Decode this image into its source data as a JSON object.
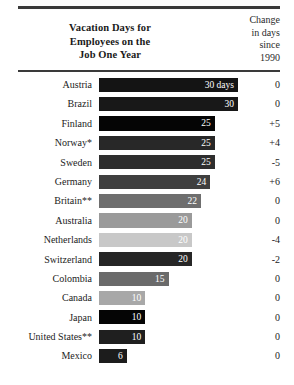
{
  "header": {
    "title_lines": [
      "Vacation Days for",
      "Employees on the",
      "Job One Year"
    ],
    "change_column_lines": [
      "Change",
      "in days",
      "since",
      "1990"
    ]
  },
  "chart_data": {
    "type": "bar",
    "title": "Vacation Days for Employees on the Job One Year",
    "xlabel": "",
    "ylabel": "",
    "orientation": "horizontal",
    "grid": false,
    "legend": null,
    "xlim": [
      0,
      30
    ],
    "categories": [
      "Austria",
      "Brazil",
      "Finland",
      "Norway*",
      "Sweden",
      "Germany",
      "Britain**",
      "Australia",
      "Netherlands",
      "Switzerland",
      "Colombia",
      "Canada",
      "Japan",
      "United States**",
      "Mexico"
    ],
    "values": [
      30,
      30,
      25,
      25,
      25,
      24,
      22,
      20,
      20,
      20,
      15,
      10,
      10,
      10,
      6
    ],
    "value_labels": [
      "30 days",
      "30",
      "25",
      "25",
      "25",
      "24",
      "22",
      "20",
      "20",
      "20",
      "15",
      "10",
      "10",
      "10",
      "6"
    ],
    "series": [
      {
        "name": "Vacation days",
        "values": [
          30,
          30,
          25,
          25,
          25,
          24,
          22,
          20,
          20,
          20,
          15,
          10,
          10,
          10,
          6
        ]
      },
      {
        "name": "Change in days since 1990",
        "values": [
          0,
          0,
          5,
          4,
          -5,
          6,
          0,
          0,
          -4,
          -2,
          0,
          0,
          0,
          0,
          0
        ]
      }
    ],
    "change_labels": [
      "0",
      "0",
      "+5",
      "+4",
      "-5",
      "+6",
      "0",
      "0",
      "-4",
      "-2",
      "0",
      "0",
      "0",
      "0",
      "0"
    ],
    "bar_colors": [
      "#141414",
      "#181818",
      "#050505",
      "#282828",
      "#2e2e2e",
      "#3f3f3f",
      "#6e6e6e",
      "#9a9a9a",
      "#c8c8c8",
      "#262626",
      "#6a6a6a",
      "#a8a8a8",
      "#050505",
      "#1f1f1f",
      "#1c1c1c"
    ],
    "bar_label_colors": [
      "#ffffff",
      "#ffffff",
      "#ffffff",
      "#ffffff",
      "#ffffff",
      "#ffffff",
      "#ffffff",
      "#ffffff",
      "#ffffff",
      "#ffffff",
      "#ffffff",
      "#ffffff",
      "#ffffff",
      "#ffffff",
      "#ffffff"
    ],
    "accent_rule_color": "#3a3a3a",
    "background_color": "#ffffff"
  },
  "rows": [
    {
      "country": "Austria",
      "value": 30,
      "label": "30 days",
      "change": "0"
    },
    {
      "country": "Brazil",
      "value": 30,
      "label": "30",
      "change": "0"
    },
    {
      "country": "Finland",
      "value": 25,
      "label": "25",
      "change": "+5"
    },
    {
      "country": "Norway*",
      "value": 25,
      "label": "25",
      "change": "+4"
    },
    {
      "country": "Sweden",
      "value": 25,
      "label": "25",
      "change": "-5"
    },
    {
      "country": "Germany",
      "value": 24,
      "label": "24",
      "change": "+6"
    },
    {
      "country": "Britain**",
      "value": 22,
      "label": "22",
      "change": "0"
    },
    {
      "country": "Australia",
      "value": 20,
      "label": "20",
      "change": "0"
    },
    {
      "country": "Netherlands",
      "value": 20,
      "label": "20",
      "change": "-4"
    },
    {
      "country": "Switzerland",
      "value": 20,
      "label": "20",
      "change": "-2"
    },
    {
      "country": "Colombia",
      "value": 15,
      "label": "15",
      "change": "0"
    },
    {
      "country": "Canada",
      "value": 10,
      "label": "10",
      "change": "0"
    },
    {
      "country": "Japan",
      "value": 10,
      "label": "10",
      "change": "0"
    },
    {
      "country": "United States**",
      "value": 10,
      "label": "10",
      "change": "0"
    },
    {
      "country": "Mexico",
      "value": 6,
      "label": "6",
      "change": "0"
    }
  ]
}
